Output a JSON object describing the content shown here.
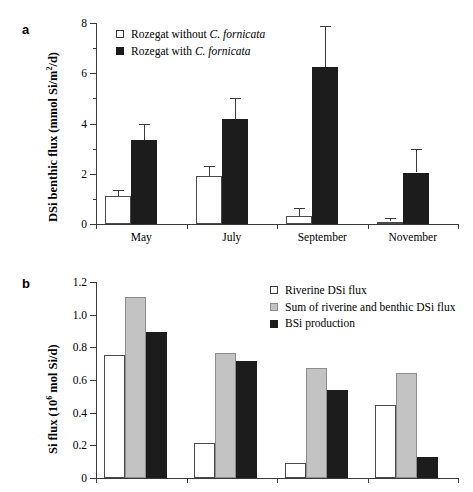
{
  "figure": {
    "background": "#ffffff",
    "panels": [
      {
        "letter": "a",
        "ylabel_main": "DSi benthic flux (mmol Si/m",
        "ylabel_sup": "2",
        "ylabel_tail": "/d)"
      },
      {
        "letter": "b",
        "ylabel_main": "Si flux (10",
        "ylabel_sup": "6",
        "ylabel_tail": " mol Si/d)"
      }
    ]
  },
  "legend_a": {
    "items": [
      {
        "marker": "open",
        "text_pre": "Rozegat without ",
        "text_italic": "C. fornicata",
        "text_post": ""
      },
      {
        "marker": "filled",
        "text_pre": "Rozegat with ",
        "text_italic": "C. fornicata",
        "text_post": ""
      }
    ]
  },
  "legend_b": {
    "items": [
      {
        "marker": "open",
        "text_pre": "Riverine DSi flux",
        "text_italic": "",
        "text_post": ""
      },
      {
        "marker": "grey",
        "text_pre": "Sum of riverine and benthic DSi flux",
        "text_italic": "",
        "text_post": ""
      },
      {
        "marker": "filled",
        "text_pre": "BSi production",
        "text_italic": "",
        "text_post": ""
      }
    ]
  },
  "chart_data": [
    {
      "id": "panel-a",
      "type": "bar",
      "title": "",
      "panel_letter": "a",
      "xlabel": "",
      "ylabel": "DSi benthic flux (mmol Si/m2/d)",
      "ylim": [
        0,
        8
      ],
      "yticks": [
        0,
        2,
        4,
        6,
        8
      ],
      "ytick_labels": [
        "0",
        "2",
        "4",
        "6",
        "8"
      ],
      "yminor_step": 1,
      "grid": false,
      "legend_position": "top-left-inside",
      "categories": [
        "May",
        "July",
        "September",
        "November"
      ],
      "series": [
        {
          "name": "Rozegat without C. fornicata",
          "style": "open",
          "values": [
            1.1,
            1.92,
            0.3,
            0.1
          ],
          "errors_upper": [
            0.25,
            0.4,
            0.35,
            0.12
          ]
        },
        {
          "name": "Rozegat with C. fornicata",
          "style": "filled",
          "values": [
            3.33,
            4.18,
            6.25,
            2.05
          ],
          "errors_upper": [
            0.67,
            0.82,
            1.62,
            0.95
          ]
        }
      ]
    },
    {
      "id": "panel-b",
      "type": "bar",
      "title": "",
      "panel_letter": "b",
      "xlabel": "",
      "ylabel": "Si flux (10^6 mol Si/d)",
      "ylim": [
        0,
        1.2
      ],
      "yticks": [
        0,
        0.2,
        0.4,
        0.6,
        0.8,
        1.0,
        1.2
      ],
      "ytick_labels": [
        "0",
        "0.2",
        "0.4",
        "0.6",
        "0.8",
        "1.0",
        "1.2"
      ],
      "grid": false,
      "legend_position": "top-right-inside",
      "categories": [
        "",
        "",
        "",
        ""
      ],
      "series": [
        {
          "name": "Riverine DSi flux",
          "style": "open",
          "values": [
            0.752,
            0.216,
            0.091,
            0.449
          ]
        },
        {
          "name": "Sum of riverine and benthic DSi flux",
          "style": "grey",
          "values": [
            1.111,
            0.765,
            0.675,
            0.646
          ]
        },
        {
          "name": "BSi production",
          "style": "filled",
          "values": [
            0.894,
            0.714,
            0.54,
            0.128
          ]
        }
      ]
    }
  ]
}
